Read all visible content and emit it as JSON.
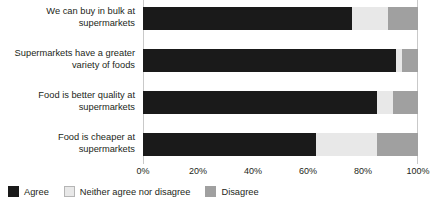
{
  "chart_data": {
    "type": "bar",
    "orientation": "horizontal",
    "stacked": true,
    "stack_mode": "percent",
    "title": "",
    "xlabel": "",
    "ylabel": "",
    "xlim": [
      0,
      100
    ],
    "xticks": [
      "0%",
      "20%",
      "40%",
      "60%",
      "80%",
      "100%"
    ],
    "xtick_values": [
      0,
      20,
      40,
      60,
      80,
      100
    ],
    "grid": false,
    "legend_position": "bottom-left",
    "categories": [
      "We can buy in bulk at supermarkets",
      "Supermarkets have a greater variety of foods",
      "Food is better quality at supermarkets",
      "Food is cheaper at supermarkets"
    ],
    "series": [
      {
        "name": "Agree",
        "color": "#1a1a1a",
        "values": [
          76,
          92,
          85,
          63
        ]
      },
      {
        "name": "Neither agree nor disagree",
        "color": "#e8e8e8",
        "values": [
          13,
          2,
          6,
          22
        ]
      },
      {
        "name": "Disagree",
        "color": "#a0a0a0",
        "values": [
          11,
          6,
          9,
          15
        ]
      }
    ]
  },
  "categories": [
    {
      "line1": "We can buy in bulk at",
      "line2": "supermarkets"
    },
    {
      "line1": "Supermarkets have a greater",
      "line2": "variety of foods"
    },
    {
      "line1": "Food is better quality at",
      "line2": "supermarkets"
    },
    {
      "line1": "Food is cheaper at",
      "line2": "supermarkets"
    }
  ],
  "legend": [
    {
      "label": "Agree",
      "color": "#1a1a1a"
    },
    {
      "label": "Neither agree nor disagree",
      "color": "#e8e8e8"
    },
    {
      "label": "Disagree",
      "color": "#a0a0a0"
    }
  ]
}
